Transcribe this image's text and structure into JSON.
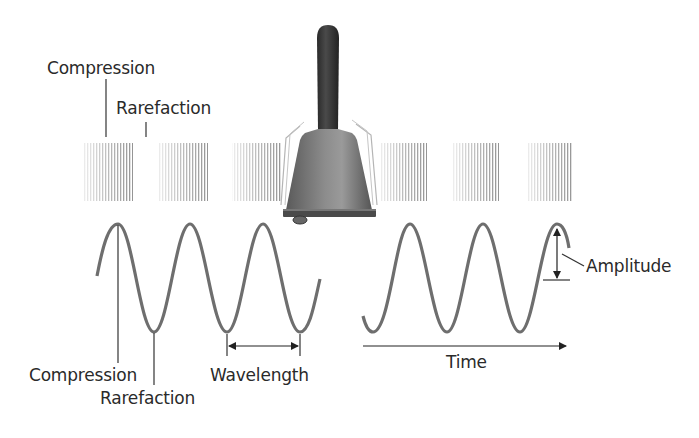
{
  "diagram": {
    "type": "sound-wave-illustration",
    "source_label": "hand-bell",
    "colors": {
      "wave": "#6e6e6e",
      "line": "#333333",
      "text": "#2a2a2a",
      "bell_body": "#7a7a7a",
      "bell_handle": "#3a3a3a",
      "compression_pattern": "#9a9a9a"
    },
    "top_labels": {
      "compression": "Compression",
      "rarefaction": "Rarefaction"
    },
    "left_wave": {
      "compression_label": "Compression",
      "rarefaction_label": "Rarefaction",
      "wavelength_label": "Wavelength"
    },
    "right_wave": {
      "amplitude_label": "Amplitude",
      "time_label": "Time"
    },
    "compression_blocks": [
      {
        "x": 83,
        "w": 50
      },
      {
        "x": 158,
        "w": 50
      },
      {
        "x": 232,
        "w": 50
      },
      {
        "x": 380,
        "w": 47
      },
      {
        "x": 453,
        "w": 46
      },
      {
        "x": 527,
        "w": 46
      }
    ]
  }
}
